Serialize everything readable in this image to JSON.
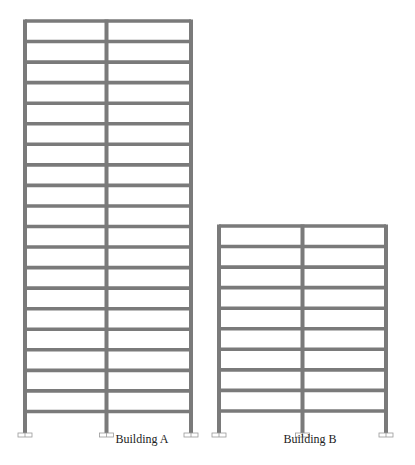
{
  "diagram": {
    "type": "structural-frame-elevations",
    "colors": {
      "member": "#7a7a7a",
      "support": "#9a9a9a",
      "background": "#ffffff"
    },
    "buildings": [
      {
        "name": "Building A",
        "label": "Building A",
        "bays": 2,
        "stories": 20,
        "columns_x": [
          25,
          106.5,
          191
        ],
        "top_y": 21,
        "base_y": 433,
        "story_height": 20.55,
        "label_x": 142,
        "label_y": 440
      },
      {
        "name": "Building B",
        "label": "Building B",
        "bays": 2,
        "stories": 10,
        "columns_x": [
          219,
          302.5,
          386
        ],
        "top_y": 226,
        "base_y": 433,
        "story_height": 20.55,
        "label_x": 310,
        "label_y": 440
      }
    ]
  }
}
